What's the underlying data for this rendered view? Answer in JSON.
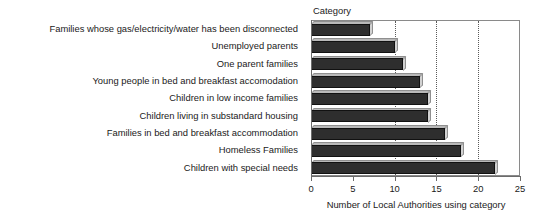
{
  "chart_data": {
    "type": "bar",
    "orientation": "horizontal",
    "title": "",
    "xlabel": "Number of Local Authorities using category",
    "ylabel": "Category",
    "xlim": [
      0,
      25
    ],
    "xticks": [
      0,
      5,
      10,
      15,
      20,
      25
    ],
    "xtick_labels": [
      "0",
      "5",
      "10",
      "15",
      "20",
      "25"
    ],
    "gridlines": [
      10,
      15,
      20
    ],
    "grid": true,
    "legend": "none",
    "categories": [
      "Families whose gas/electricity/water has been disconnected",
      "Unemployed parents",
      "One parent families",
      "Young people in bed and breakfast accomodation",
      "Children in low income families",
      "Children living in substandard housing",
      "Families in bed and breakfast accommodation",
      "Homeless Families",
      "Children with special needs"
    ],
    "values": [
      7,
      10,
      11,
      13,
      14,
      14,
      16,
      18,
      22
    ],
    "bar_color": "#2e2e2e",
    "bar_top_color": "#b9b9b9",
    "bar_side_color": "#d2d2d2"
  }
}
